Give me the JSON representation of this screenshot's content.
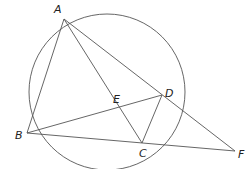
{
  "diagram": {
    "type": "geometry",
    "circle": {
      "cx": 107,
      "cy": 92,
      "r": 78,
      "color": "#555555"
    },
    "points": {
      "A": {
        "x": 64,
        "y": 19,
        "label": "A",
        "lx": 54,
        "ly": 13
      },
      "B": {
        "x": 27,
        "y": 133,
        "label": "B",
        "lx": 15,
        "ly": 139
      },
      "C": {
        "x": 142,
        "y": 143,
        "label": "C",
        "lx": 139,
        "ly": 157
      },
      "D": {
        "x": 162,
        "y": 95,
        "label": "D",
        "lx": 165,
        "ly": 97
      },
      "E": {
        "x": 120,
        "y": 108,
        "label": "E",
        "lx": 113,
        "ly": 103
      },
      "F": {
        "x": 235,
        "y": 151,
        "label": "F",
        "lx": 238,
        "ly": 158
      }
    },
    "segments": [
      [
        "A",
        "B"
      ],
      [
        "A",
        "C"
      ],
      [
        "A",
        "F"
      ],
      [
        "B",
        "D"
      ],
      [
        "B",
        "F"
      ],
      [
        "C",
        "D"
      ]
    ]
  }
}
